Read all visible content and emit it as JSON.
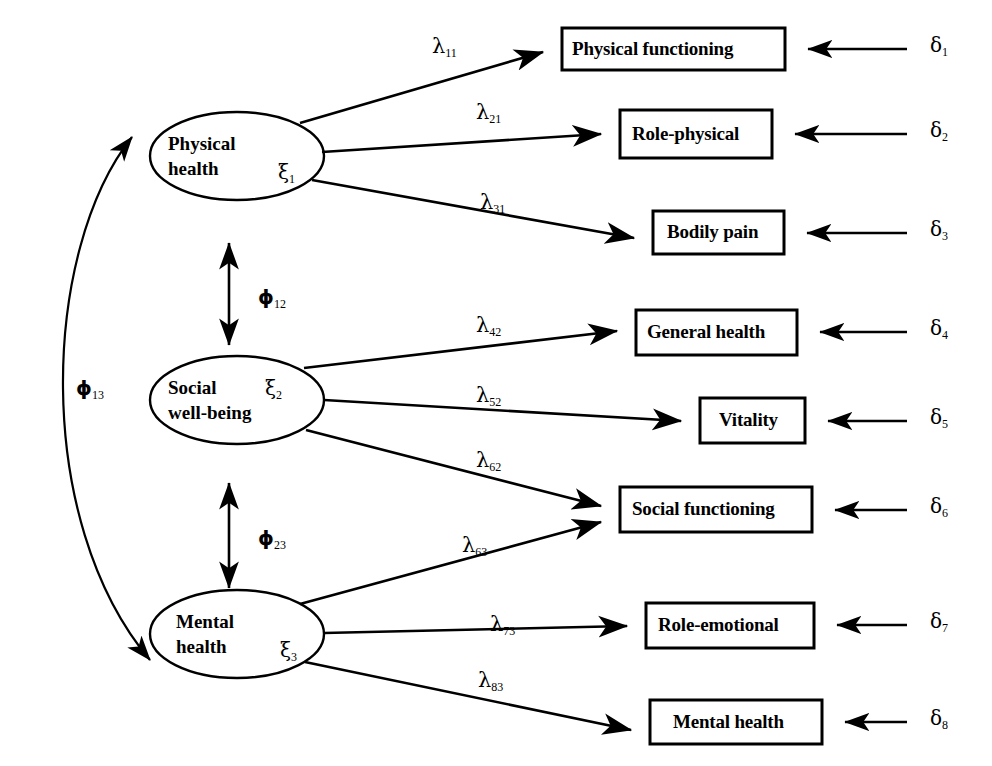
{
  "diagram": {
    "type": "structural-equation-model-path-diagram",
    "latent_variables": [
      {
        "id": "xi1",
        "line1": "Physical",
        "line2": "health",
        "symbol": "ξ",
        "subscript": "1",
        "cx": 237,
        "cy": 156,
        "rx": 87,
        "ry": 44
      },
      {
        "id": "xi2",
        "line1": "Social",
        "line2": "well-being",
        "symbol": "ξ",
        "subscript": "2",
        "cx": 237,
        "cy": 400,
        "rx": 87,
        "ry": 44
      },
      {
        "id": "xi3",
        "line1": "Mental",
        "line2": "health",
        "symbol": "ξ",
        "subscript": "3",
        "cx": 237,
        "cy": 634,
        "rx": 87,
        "ry": 44
      }
    ],
    "observed_variables": [
      {
        "id": "y1",
        "label": "Physical functioning",
        "x": 562,
        "y": 28,
        "w": 223,
        "h": 42
      },
      {
        "id": "y2",
        "label": "Role-physical",
        "x": 620,
        "y": 110,
        "w": 152,
        "h": 48
      },
      {
        "id": "y3",
        "label": "Bodily pain",
        "x": 653,
        "y": 211,
        "w": 131,
        "h": 43
      },
      {
        "id": "y4",
        "label": "General health",
        "x": 636,
        "y": 310,
        "w": 161,
        "h": 45
      },
      {
        "id": "y5",
        "label": "Vitality",
        "x": 700,
        "y": 398,
        "w": 105,
        "h": 45
      },
      {
        "id": "y6",
        "label": "Social functioning",
        "x": 620,
        "y": 487,
        "w": 192,
        "h": 45
      },
      {
        "id": "y7",
        "label": "Role-emotional",
        "x": 646,
        "y": 603,
        "w": 168,
        "h": 45
      },
      {
        "id": "y8",
        "label": "Mental health",
        "x": 650,
        "y": 700,
        "w": 172,
        "h": 44
      }
    ],
    "loadings": [
      {
        "id": "l11",
        "symbol": "λ",
        "subscript": "11",
        "lx": 432,
        "ly": 34,
        "from": "xi1",
        "to": "y1"
      },
      {
        "id": "l21",
        "symbol": "λ",
        "subscript": "21",
        "lx": 476,
        "ly": 100,
        "from": "xi1",
        "to": "y2"
      },
      {
        "id": "l31",
        "symbol": "λ",
        "subscript": "31",
        "lx": 480,
        "ly": 190,
        "from": "xi1",
        "to": "y3"
      },
      {
        "id": "l42",
        "symbol": "λ",
        "subscript": "42",
        "lx": 476,
        "ly": 313,
        "from": "xi2",
        "to": "y4"
      },
      {
        "id": "l52",
        "symbol": "λ",
        "subscript": "52",
        "lx": 476,
        "ly": 383,
        "from": "xi2",
        "to": "y5"
      },
      {
        "id": "l62",
        "symbol": "λ",
        "subscript": "62",
        "lx": 476,
        "ly": 448,
        "from": "xi2",
        "to": "y6"
      },
      {
        "id": "l63",
        "symbol": "λ",
        "subscript": "63",
        "lx": 462,
        "ly": 533,
        "from": "xi3",
        "to": "y6"
      },
      {
        "id": "l73",
        "symbol": "λ",
        "subscript": "73",
        "lx": 490,
        "ly": 612,
        "from": "xi3",
        "to": "y7"
      },
      {
        "id": "l83",
        "symbol": "λ",
        "subscript": "83",
        "lx": 478,
        "ly": 668,
        "from": "xi3",
        "to": "y8"
      }
    ],
    "errors": [
      {
        "id": "d1",
        "symbol": "δ",
        "subscript": "1",
        "lx": 930,
        "ly": 33,
        "y": 49
      },
      {
        "id": "d2",
        "symbol": "δ",
        "subscript": "2",
        "lx": 930,
        "ly": 120,
        "y": 134
      },
      {
        "id": "d3",
        "symbol": "δ",
        "subscript": "3",
        "lx": 930,
        "ly": 219,
        "y": 233
      },
      {
        "id": "d4",
        "symbol": "δ",
        "subscript": "4",
        "lx": 930,
        "ly": 318,
        "y": 332
      },
      {
        "id": "d5",
        "symbol": "δ",
        "subscript": "5",
        "lx": 930,
        "ly": 408,
        "y": 421
      },
      {
        "id": "d6",
        "symbol": "δ",
        "subscript": "6",
        "lx": 930,
        "ly": 497,
        "y": 510
      },
      {
        "id": "d7",
        "symbol": "δ",
        "subscript": "7",
        "lx": 930,
        "ly": 611,
        "y": 625
      },
      {
        "id": "d8",
        "symbol": "δ",
        "subscript": "8",
        "lx": 930,
        "ly": 708,
        "y": 722
      }
    ],
    "covariances": [
      {
        "id": "phi12",
        "symbol": "ϕ",
        "subscript": "12",
        "lx": 258,
        "ly": 287,
        "between": [
          "xi1",
          "xi2"
        ]
      },
      {
        "id": "phi23",
        "symbol": "ϕ",
        "subscript": "23",
        "lx": 258,
        "ly": 528,
        "between": [
          "xi2",
          "xi3"
        ]
      },
      {
        "id": "phi13",
        "symbol": "ϕ",
        "subscript": "13",
        "lx": 76,
        "ly": 378,
        "between": [
          "xi1",
          "xi3"
        ]
      }
    ],
    "colors": {
      "stroke": "#000000",
      "background": "#ffffff",
      "text": "#000000"
    }
  }
}
